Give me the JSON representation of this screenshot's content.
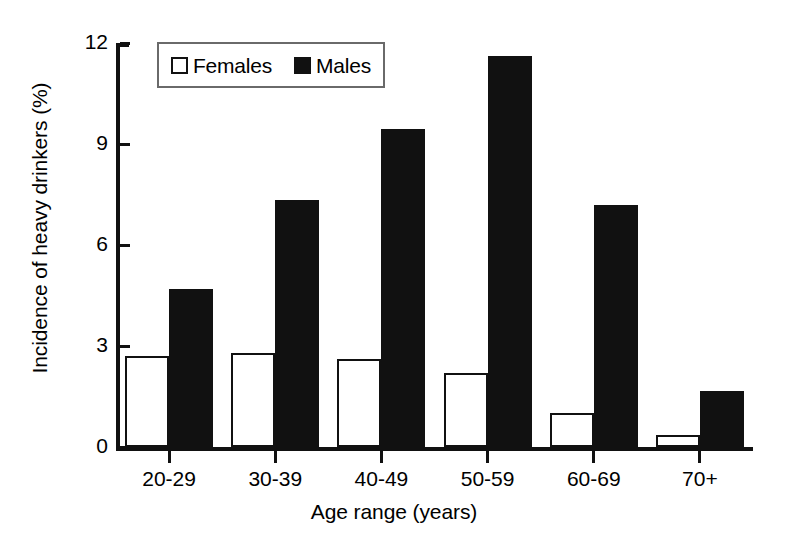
{
  "chart_data": {
    "type": "bar",
    "title": "",
    "xlabel": "Age range (years)",
    "ylabel": "Incidence of heavy drinkers (%)",
    "categories": [
      "20-29",
      "30-39",
      "40-49",
      "50-59",
      "60-69",
      "70+"
    ],
    "series": [
      {
        "name": "Females",
        "values": [
          2.7,
          2.8,
          2.6,
          2.2,
          1.0,
          0.35
        ],
        "fill": "#ffffff",
        "edge": "#111111"
      },
      {
        "name": "Males",
        "values": [
          4.7,
          7.35,
          9.45,
          11.6,
          7.2,
          1.65
        ],
        "fill": "#111111",
        "edge": "#111111"
      }
    ],
    "ylim": [
      0,
      12
    ],
    "yticks": [
      0,
      3,
      6,
      9,
      12
    ],
    "ytick_labels": [
      "0",
      "3",
      "6",
      "9",
      "12"
    ],
    "grid": false,
    "legend_position": "upper-left-inside",
    "legend_entries": [
      "Females",
      "Males"
    ]
  },
  "legend": {
    "females_label": "Females",
    "males_label": "Males",
    "females_swatch": "open-square-icon",
    "males_swatch": "filled-square-icon"
  },
  "axes": {
    "y_title": "Incidence of heavy drinkers (%)",
    "x_title": "Age range (years)"
  }
}
